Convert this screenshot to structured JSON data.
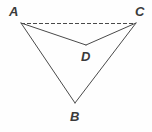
{
  "figure": {
    "type": "geometry-diagram",
    "background_color": "#fefefe",
    "stroke_color": "#4a4a4a",
    "label_color": "#3a3a3a",
    "stroke_width": 1,
    "dash_pattern": "4 2",
    "width": 152,
    "height": 132,
    "points": {
      "A": {
        "label": "A",
        "x": 21,
        "y": 23,
        "label_x": 9,
        "label_y": 5
      },
      "B": {
        "label": "B",
        "x": 75,
        "y": 103,
        "label_x": 70,
        "label_y": 110
      },
      "C": {
        "label": "C",
        "x": 136,
        "y": 23,
        "label_x": 135,
        "label_y": 5
      },
      "D": {
        "label": "D",
        "x": 86,
        "y": 45,
        "label_x": 81,
        "label_y": 50
      }
    },
    "segments": [
      {
        "name": "segment-AC",
        "from": "A",
        "to": "C",
        "style": "dashed"
      },
      {
        "name": "segment-AD",
        "from": "A",
        "to": "D",
        "style": "solid"
      },
      {
        "name": "segment-DC",
        "from": "D",
        "to": "C",
        "style": "solid"
      },
      {
        "name": "segment-AB",
        "from": "A",
        "to": "B",
        "style": "solid"
      },
      {
        "name": "segment-BC",
        "from": "B",
        "to": "C",
        "style": "solid"
      }
    ]
  }
}
